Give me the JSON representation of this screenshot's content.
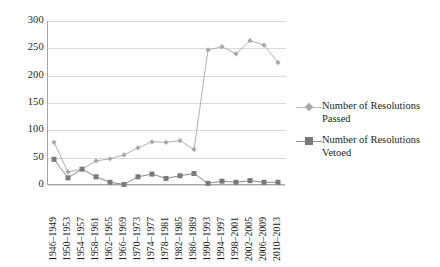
{
  "chart_data": {
    "type": "line",
    "title": "",
    "subtitle": "",
    "xlabel": "",
    "ylabel": "",
    "ylim": [
      0,
      300
    ],
    "yticks": [
      0,
      50,
      100,
      150,
      200,
      250,
      300
    ],
    "grid": true,
    "legend_position": "right",
    "categories": [
      "1946–1949",
      "1950–1953",
      "1954–1957",
      "1958–1961",
      "1962–1965",
      "1966–1969",
      "1970–1973",
      "1974–1977",
      "1978–1981",
      "1982–1985",
      "1986–1989",
      "1990–1993",
      "1994–1997",
      "1998–2001",
      "2002–2005",
      "2006–2009",
      "2010–2013"
    ],
    "series": [
      {
        "name": "Number of Resolutions Passed",
        "marker": "diamond",
        "color": "#a8a8a8",
        "values": [
          78,
          24,
          29,
          44,
          48,
          55,
          68,
          79,
          78,
          81,
          65,
          247,
          253,
          240,
          264,
          256,
          224
        ]
      },
      {
        "name": "Number of Resolutions Vetoed",
        "marker": "square",
        "color": "#7a7a7a",
        "values": [
          47,
          13,
          29,
          15,
          5,
          1,
          15,
          20,
          12,
          17,
          21,
          3,
          7,
          5,
          8,
          5,
          5
        ]
      }
    ]
  },
  "legend": {
    "items": [
      {
        "label_line1": "Number of Resolutions",
        "label_line2": "Passed",
        "marker": "diamond-marker"
      },
      {
        "label_line1": "Number of Resolutions",
        "label_line2": "Vetoed",
        "marker": "square-marker"
      }
    ]
  }
}
